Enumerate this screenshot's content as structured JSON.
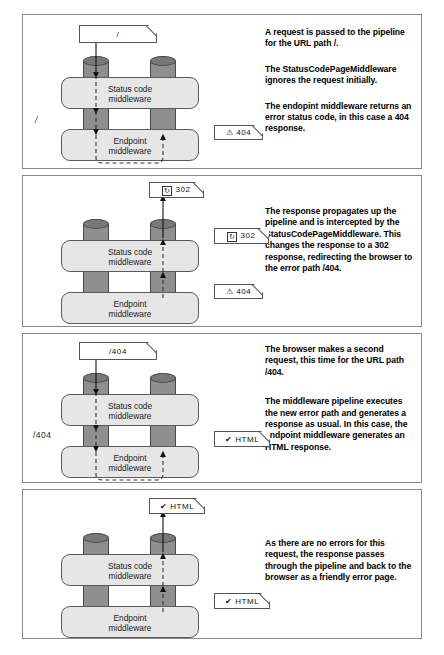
{
  "diagram": {
    "labels": {
      "status_code_mw_line1": "Status code",
      "status_code_mw_line2": "middleware",
      "endpoint_mw_line1": "Endpoint",
      "endpoint_mw_line2": "middleware"
    },
    "icons": {
      "warning": "warning-triangle-icon",
      "redirect": "redirect-circle-icon",
      "check": "check-mark-icon"
    }
  },
  "panels": [
    {
      "id": "panel-1",
      "request_doc": {
        "text": "/",
        "icon": "none"
      },
      "left_path_label": "/",
      "badges": [
        {
          "icon": "warning-triangle-icon",
          "glyph": "⚠",
          "text": "404"
        }
      ],
      "paragraphs": [
        "A request is passed to the pipeline for the URL path /.",
        "The StatusCodePageMiddleware ignores the request initially.",
        "The endopint middleware returns an error status code, in this case a 404 response."
      ]
    },
    {
      "id": "panel-2",
      "request_doc": {
        "text": "302",
        "icon": "redirect-circle-icon",
        "glyph": "↻"
      },
      "left_path_label": "",
      "badges": [
        {
          "icon": "redirect-circle-icon",
          "glyph": "↻",
          "text": "302"
        },
        {
          "icon": "warning-triangle-icon",
          "glyph": "⚠",
          "text": "404"
        }
      ],
      "paragraphs": [
        "The response propagates up the pipeline and is intercepted by the StatusCodePageMiddleware. This changes the response to a 302 response, redirecting the browser to the error path /404."
      ]
    },
    {
      "id": "panel-3",
      "request_doc": {
        "text": "/404",
        "icon": "none"
      },
      "left_path_label": "/404",
      "badges": [
        {
          "icon": "check-mark-icon",
          "glyph": "✔",
          "text": "HTML"
        }
      ],
      "paragraphs": [
        "The browser makes a second request, this time for the URL path /404.",
        "The middleware pipeline executes the new error path and generates a response as usual. In this case, the endpoint middleware generates an HTML response."
      ]
    },
    {
      "id": "panel-4",
      "request_doc": {
        "text": "HTML",
        "icon": "check-mark-icon",
        "glyph": "✔"
      },
      "left_path_label": "",
      "badges": [
        {
          "icon": "check-mark-icon",
          "glyph": "✔",
          "text": "HTML"
        }
      ],
      "paragraphs": [
        "As there are no errors for this request, the response passes through the pipeline and back to the browser as a friendly error page."
      ]
    }
  ],
  "colors": {
    "pipe_fill": "#8f8f8f",
    "pipe_cap": "#787878",
    "middleware_fill": "#e6e6e6",
    "stroke": "#555555",
    "background": "#ffffff"
  }
}
